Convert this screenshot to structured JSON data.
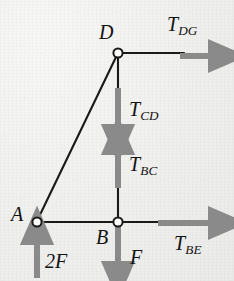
{
  "figure": {
    "type": "free-body-force-diagram",
    "background_color": "#efefed",
    "member_color": "#151515",
    "arrow_color": "#8a8a8a",
    "node_fill": "#ffffff",
    "node_stroke": "#151515",
    "width": 234,
    "height": 281
  },
  "nodes": [
    {
      "id": "D",
      "label": "D",
      "x": 118,
      "y": 53,
      "label_x": 99,
      "label_y": 22
    },
    {
      "id": "A",
      "label": "A",
      "x": 37,
      "y": 222,
      "label_x": 11,
      "label_y": 205
    },
    {
      "id": "B",
      "label": "B",
      "x": 118,
      "y": 222,
      "label_x": 96,
      "label_y": 228
    }
  ],
  "members": [
    {
      "id": "member-AD",
      "from": "A",
      "to": "D",
      "x1": 37,
      "y1": 222,
      "x2": 118,
      "y2": 53
    },
    {
      "id": "member-AB",
      "from": "A",
      "to": "B",
      "x1": 37,
      "y1": 222,
      "x2": 118,
      "y2": 222
    },
    {
      "id": "member-DB",
      "from": "D",
      "to": "B",
      "x1": 118,
      "y1": 53,
      "x2": 118,
      "y2": 222
    },
    {
      "id": "member-DG-stub",
      "from": "D",
      "to": "G",
      "x1": 118,
      "y1": 53,
      "x2": 183,
      "y2": 53
    },
    {
      "id": "member-BE-stub",
      "from": "B",
      "to": "E",
      "x1": 118,
      "y1": 222,
      "x2": 160,
      "y2": 222
    }
  ],
  "forces": [
    {
      "id": "T_DG",
      "symbol": "T",
      "subscript": "DG",
      "direction": "right",
      "x1": 180,
      "y1": 56,
      "x2": 222,
      "y2": 56,
      "label_x": 167,
      "label_y": 14
    },
    {
      "id": "T_CD",
      "symbol": "T",
      "subscript": "CD",
      "direction": "down",
      "x1": 118,
      "y1": 88,
      "x2": 118,
      "y2": 138,
      "label_x": 129,
      "label_y": 100
    },
    {
      "id": "T_BC",
      "symbol": "T",
      "subscript": "BC",
      "direction": "up",
      "x1": 118,
      "y1": 188,
      "x2": 118,
      "y2": 141,
      "label_x": 129,
      "label_y": 155
    },
    {
      "id": "T_BE",
      "symbol": "T",
      "subscript": "BE",
      "direction": "right",
      "x1": 158,
      "y1": 223,
      "x2": 222,
      "y2": 223,
      "label_x": 174,
      "label_y": 233
    },
    {
      "id": "2F",
      "symbol": "2F",
      "subscript": "",
      "direction": "up",
      "x1": 37,
      "y1": 278,
      "x2": 37,
      "y2": 231,
      "label_x": 45,
      "label_y": 252
    },
    {
      "id": "F",
      "symbol": "F",
      "subscript": "",
      "direction": "down",
      "x1": 118,
      "y1": 226,
      "x2": 118,
      "y2": 275,
      "label_x": 130,
      "label_y": 248
    }
  ],
  "labels": {
    "node_D": "D",
    "node_A": "A",
    "node_B": "B",
    "force_T": "T",
    "sub_DG": "DG",
    "sub_CD": "CD",
    "sub_BC": "BC",
    "sub_BE": "BE",
    "force_2F": "2F",
    "force_F": "F"
  }
}
